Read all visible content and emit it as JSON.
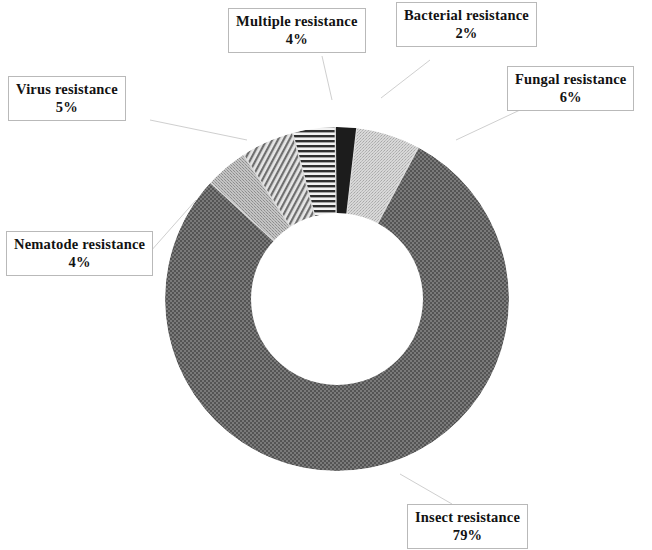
{
  "chart_data": {
    "type": "pie",
    "variant": "donut",
    "title": "",
    "subtitle": "",
    "xlabel": "",
    "ylabel": "",
    "legend_position": "callout-labels",
    "grid": false,
    "units": "percent",
    "total": 100,
    "categories": [
      "Insect resistance",
      "Fungal resistance",
      "Bacterial resistance",
      "Multiple resistance",
      "Virus resistance",
      "Nematode resistance"
    ],
    "values": [
      79,
      6,
      2,
      4,
      5,
      4
    ],
    "slices": [
      {
        "label": "Insect resistance",
        "value": 79,
        "value_text": "79%",
        "fill": "#6e6e6e",
        "pattern": "checker-dark",
        "start_angle_deg": 40.0,
        "end_angle_deg": 324.4
      },
      {
        "label": "Fungal resistance",
        "value": 6,
        "value_text": "6%",
        "fill": "#c9c9c9",
        "pattern": "stipple-light",
        "start_angle_deg": 18.4,
        "end_angle_deg": 40.0
      },
      {
        "label": "Bacterial resistance",
        "value": 2,
        "value_text": "2%",
        "fill": "#1c1c1c",
        "pattern": "solid-black",
        "start_angle_deg": 11.2,
        "end_angle_deg": 18.4
      },
      {
        "label": "Multiple resistance",
        "value": 4,
        "value_text": "4%",
        "fill": "#9a9a9a",
        "pattern": "horizontal-lines",
        "start_angle_deg": 345.0,
        "end_angle_deg": 11.2
      },
      {
        "label": "Virus resistance",
        "value": 5,
        "value_text": "5%",
        "fill": "#8f8f8f",
        "pattern": "diagonal-hatch",
        "start_angle_deg": 327.0,
        "end_angle_deg": 345.0
      },
      {
        "label": "Nematode resistance",
        "value": 4,
        "value_text": "4%",
        "fill": "#b4b4b4",
        "pattern": "stipple-medium",
        "start_angle_deg": 324.4,
        "end_angle_deg": 327.0
      }
    ],
    "geometry": {
      "center_x": 337,
      "center_y": 299,
      "outer_radius": 172,
      "inner_radius": 86
    }
  },
  "labels": {
    "multiple": {
      "name": "Multiple resistance",
      "value": "4%"
    },
    "bacterial": {
      "name": "Bacterial resistance",
      "value": "2%"
    },
    "fungal": {
      "name": "Fungal resistance",
      "value": "6%"
    },
    "virus": {
      "name": "Virus resistance",
      "value": "5%"
    },
    "nematode": {
      "name": "Nematode resistance",
      "value": "4%"
    },
    "insect": {
      "name": "Insect resistance",
      "value": "79%"
    }
  }
}
